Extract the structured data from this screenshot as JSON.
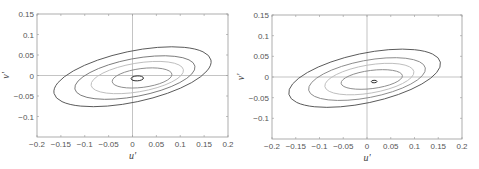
{
  "chart_data": [
    {
      "type": "contour",
      "title": "",
      "xlabel": "u'",
      "ylabel": "v'",
      "xlim": [
        -0.2,
        0.2
      ],
      "ylim": [
        -0.15,
        0.15
      ],
      "xticks": [
        "-0.2",
        "-0.15",
        "-0.1",
        "-0.05",
        "0",
        "0.05",
        "0.1",
        "0.15",
        "0.2"
      ],
      "yticks": [
        "0.15",
        "0.1",
        "0.05",
        "0",
        "-0.05",
        "-0.1"
      ],
      "grid": false,
      "reference_lines": {
        "x": 0,
        "y": 0
      },
      "contours": [
        {
          "level": 1,
          "center": [
            0.0,
            -0.003
          ],
          "rx": 0.168,
          "ry": 0.062,
          "tilt_deg": -20,
          "color": "#555555"
        },
        {
          "level": 2,
          "center": [
            0.005,
            -0.005
          ],
          "rx": 0.128,
          "ry": 0.046,
          "tilt_deg": -18,
          "color": "#777777"
        },
        {
          "level": 3,
          "center": [
            0.01,
            -0.005
          ],
          "rx": 0.098,
          "ry": 0.035,
          "tilt_deg": -16,
          "color": "#bbbbbb"
        },
        {
          "level": 4,
          "center": [
            0.02,
            -0.006
          ],
          "rx": 0.063,
          "ry": 0.023,
          "tilt_deg": -12,
          "color": "#888888"
        },
        {
          "level": 5,
          "center": [
            0.01,
            -0.007
          ],
          "rx": 0.013,
          "ry": 0.006,
          "tilt_deg": -5,
          "color": "#222222"
        }
      ]
    },
    {
      "type": "contour",
      "title": "",
      "xlabel": "u'",
      "ylabel": "v'",
      "xlim": [
        -0.2,
        0.2
      ],
      "ylim": [
        -0.15,
        0.15
      ],
      "xticks": [
        "-0.2",
        "-0.15",
        "-0.1",
        "-0.05",
        "0",
        "0.05",
        "0.1",
        "0.15",
        "0.2"
      ],
      "yticks": [
        "0.15",
        "0.1",
        "0.05",
        "0",
        "-0.05",
        "-0.1"
      ],
      "grid": false,
      "reference_lines": {
        "x": 0,
        "y": 0
      },
      "contours": [
        {
          "level": 1,
          "center": [
            -0.005,
            -0.003
          ],
          "rx": 0.163,
          "ry": 0.06,
          "tilt_deg": -20,
          "color": "#555555"
        },
        {
          "level": 2,
          "center": [
            0.0,
            -0.005
          ],
          "rx": 0.125,
          "ry": 0.045,
          "tilt_deg": -18,
          "color": "#888888"
        },
        {
          "level": 3,
          "center": [
            0.005,
            -0.005
          ],
          "rx": 0.095,
          "ry": 0.034,
          "tilt_deg": -16,
          "color": "#bbbbbb"
        },
        {
          "level": 4,
          "center": [
            0.01,
            -0.006
          ],
          "rx": 0.065,
          "ry": 0.022,
          "tilt_deg": -12,
          "color": "#888888"
        },
        {
          "level": 5,
          "center": [
            0.015,
            -0.011
          ],
          "rx": 0.006,
          "ry": 0.003,
          "tilt_deg": -5,
          "color": "#222222"
        }
      ]
    }
  ],
  "panels": [
    {
      "xlabel": "u'",
      "ylabel": "v'"
    },
    {
      "xlabel": "u'",
      "ylabel": "v'"
    }
  ]
}
